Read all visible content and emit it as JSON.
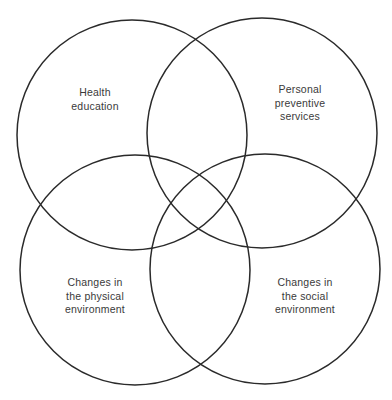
{
  "diagram": {
    "type": "venn",
    "sets": 4,
    "stroke_color": "#2a2a2a",
    "text_color": "#3a3a3a",
    "circles": [
      {
        "id": "health-education",
        "cx": 132,
        "cy": 135,
        "r": 115,
        "label_lines": [
          "Health",
          "education"
        ]
      },
      {
        "id": "personal-preventive-services",
        "cx": 262,
        "cy": 133,
        "r": 115,
        "label_lines": [
          "Personal",
          "preventive",
          "services"
        ]
      },
      {
        "id": "physical-environment",
        "cx": 135,
        "cy": 270,
        "r": 115,
        "label_lines": [
          "Changes in",
          "the physical",
          "environment"
        ]
      },
      {
        "id": "social-environment",
        "cx": 265,
        "cy": 269,
        "r": 115,
        "label_lines": [
          "Changes in",
          "the social",
          "environment"
        ]
      }
    ]
  }
}
